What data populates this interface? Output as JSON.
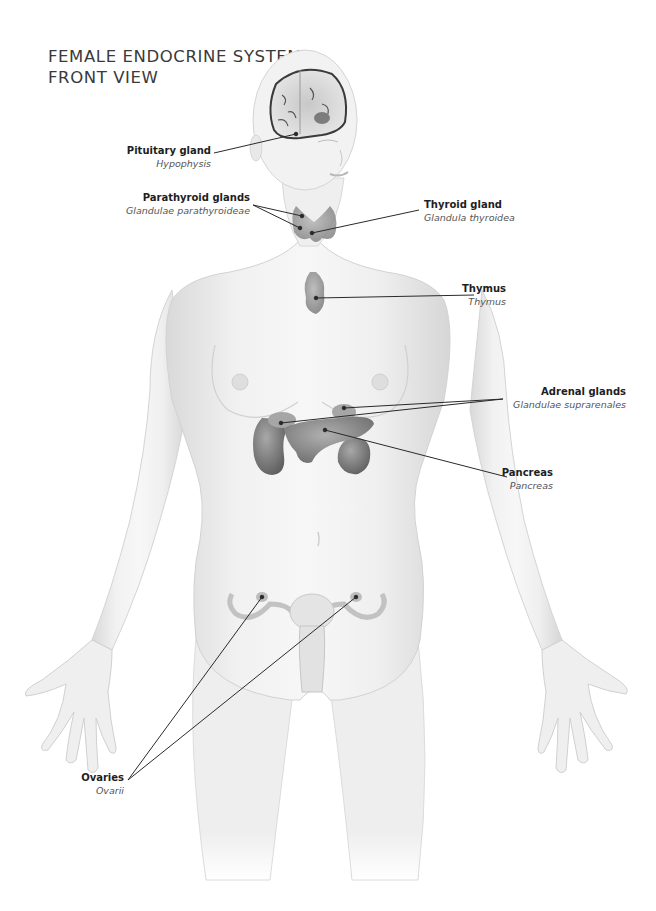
{
  "title": {
    "line1": "FEMALE ENDOCRINE SYSTEM—",
    "line2": "FRONT VIEW"
  },
  "labels": [
    {
      "id": "pituitary",
      "name": "Pituitary gland",
      "latin": "Hypophysis",
      "side": "left"
    },
    {
      "id": "parathyroid",
      "name": "Parathyroid glands",
      "latin": "Glandulae parathyroideae",
      "side": "left"
    },
    {
      "id": "thyroid",
      "name": "Thyroid gland",
      "latin": "Glandula thyroidea",
      "side": "right"
    },
    {
      "id": "thymus",
      "name": "Thymus",
      "latin": "Thymus",
      "side": "right"
    },
    {
      "id": "adrenal",
      "name": "Adrenal glands",
      "latin": "Glandulae suprarenales",
      "side": "right"
    },
    {
      "id": "pancreas",
      "name": "Pancreas",
      "latin": "Pancreas",
      "side": "right"
    },
    {
      "id": "ovaries",
      "name": "Ovaries",
      "latin": "Ovarii",
      "side": "left"
    }
  ],
  "colors": {
    "skin_light": "#f2f2f2",
    "skin_shade": "#d6d6d6",
    "organ": "#9a9a9a",
    "organ_dark": "#707070",
    "leader_line": "#2a2a2a"
  }
}
